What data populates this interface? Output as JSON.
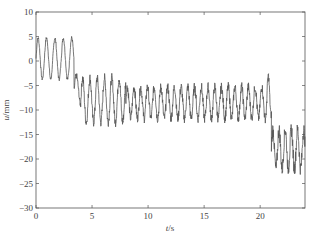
{
  "chart_data": {
    "type": "line",
    "title": "",
    "xlabel_var": "t",
    "xlabel_unit": "/s",
    "ylabel_var": "u",
    "ylabel_unit": "/mm",
    "xlim": [
      0,
      24
    ],
    "ylim": [
      -30,
      10
    ],
    "xticks": [
      0,
      5,
      10,
      15,
      20
    ],
    "yticks": [
      10,
      5,
      0,
      -5,
      -10,
      -15,
      -20,
      -25,
      -30
    ],
    "grid": false,
    "line_color": "#555555",
    "series": [
      {
        "name": "u",
        "segments": [
          {
            "t_start": 0.0,
            "t_end": 3.4,
            "mean": 0.5,
            "amp": 4.2,
            "period": 0.75,
            "noise": 0.4
          },
          {
            "t_start": 3.4,
            "t_end": 4.0,
            "mean": -6.0,
            "amp": 3.0,
            "period": 0.8,
            "noise": 0.6
          },
          {
            "t_start": 4.0,
            "t_end": 8.0,
            "mean": -8.0,
            "amp": 4.5,
            "period": 0.65,
            "noise": 1.0
          },
          {
            "t_start": 8.0,
            "t_end": 20.6,
            "mean": -8.5,
            "amp": 3.2,
            "period": 0.6,
            "noise": 1.0
          },
          {
            "t_start": 20.6,
            "t_end": 21.0,
            "mean": -7.0,
            "amp": 4.0,
            "period": 0.5,
            "noise": 0.8
          },
          {
            "t_start": 21.0,
            "t_end": 24.0,
            "mean": -18.0,
            "amp": 4.0,
            "period": 0.55,
            "noise": 1.5
          }
        ],
        "extrema": {
          "max": 5.5,
          "min": -26.5
        }
      }
    ]
  }
}
